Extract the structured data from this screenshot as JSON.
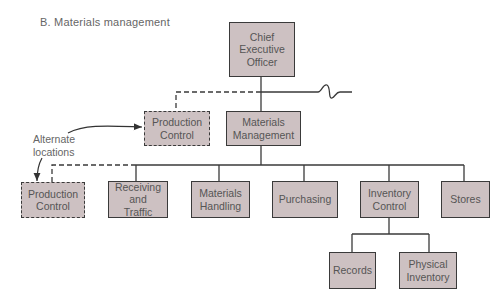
{
  "title": "B.  Materials management",
  "colors": {
    "box_fill": "#cdc1c2",
    "line": "#3a3a3a",
    "text": "#555555"
  },
  "nodes": {
    "ceo": "Chief\nExecutive\nOfficer",
    "production_control_alt": "Production\nControl",
    "materials_management": "Materials\nManagement",
    "production_control": "Production\nControl",
    "receiving_traffic": "Receiving\nand\nTraffic",
    "materials_handling": "Materials\nHandling",
    "purchasing": "Purchasing",
    "inventory_control": "Inventory\nControl",
    "stores": "Stores",
    "records": "Records",
    "physical_inventory": "Physical\nInventory"
  },
  "annotation": "Alternate\nlocations",
  "edges": [
    {
      "from": "ceo",
      "to": "materials_management",
      "style": "solid"
    },
    {
      "from": "ceo",
      "to": "production_control_alt",
      "style": "dashed"
    },
    {
      "from": "materials_management",
      "to": "production_control",
      "style": "dashed"
    },
    {
      "from": "materials_management",
      "to": "receiving_traffic",
      "style": "solid"
    },
    {
      "from": "materials_management",
      "to": "materials_handling",
      "style": "solid"
    },
    {
      "from": "materials_management",
      "to": "purchasing",
      "style": "solid"
    },
    {
      "from": "materials_management",
      "to": "inventory_control",
      "style": "solid"
    },
    {
      "from": "materials_management",
      "to": "stores",
      "style": "solid"
    },
    {
      "from": "inventory_control",
      "to": "records",
      "style": "solid"
    },
    {
      "from": "inventory_control",
      "to": "physical_inventory",
      "style": "solid"
    }
  ]
}
